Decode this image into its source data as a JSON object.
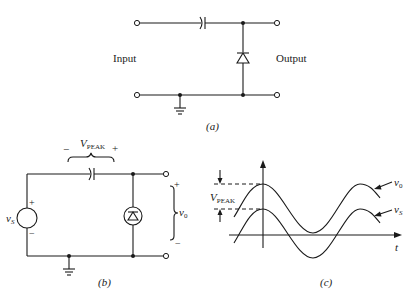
{
  "figure_a": {
    "label": "(a)",
    "input_label": "Input",
    "output_label": "Output",
    "components": [
      "series-capacitor",
      "shunt-diode",
      "ground"
    ]
  },
  "figure_b": {
    "label": "(b)",
    "source_label": "v",
    "source_sub": "S",
    "source_plus": "+",
    "source_minus": "−",
    "cap_voltage_label": "V",
    "cap_voltage_sub": "PEAK",
    "cap_minus": "−",
    "cap_plus": "+",
    "output_label": "v",
    "output_sub": "0",
    "output_plus": "+",
    "output_minus": "−"
  },
  "figure_c": {
    "label": "(c)",
    "axis_t": "t",
    "vpeak_label": "V",
    "vpeak_sub": "PEAK",
    "v0_label": "v",
    "v0_sub": "0",
    "vs_label": "v",
    "vs_sub": "S"
  }
}
